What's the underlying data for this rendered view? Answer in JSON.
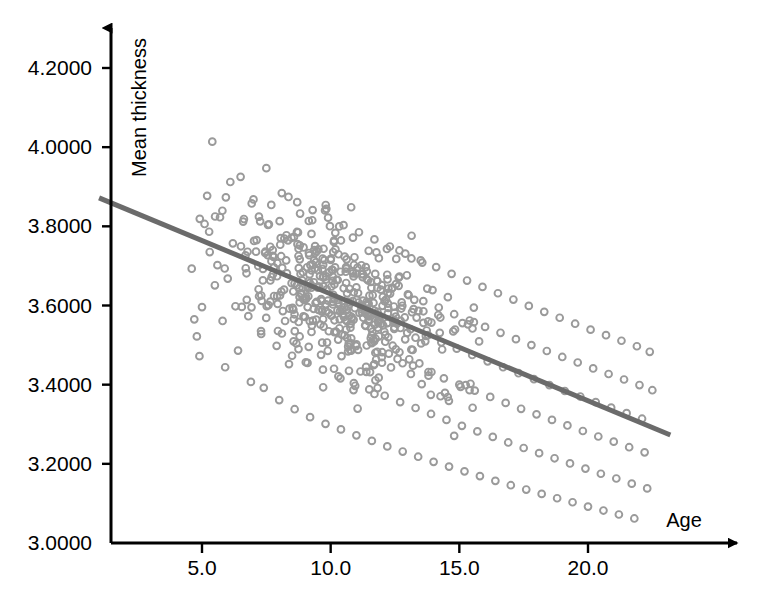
{
  "chart_data": {
    "type": "scatter",
    "title": "",
    "xlabel": "Age",
    "ylabel": "Mean thickness",
    "grid": false,
    "legend": "none",
    "xlim": [
      1.0,
      24.0
    ],
    "ylim": [
      3.0,
      4.28
    ],
    "xticks": [
      "5.0",
      "10.0",
      "15.0",
      "20.0"
    ],
    "xtick_values": [
      5.0,
      10.0,
      15.0,
      20.0
    ],
    "yticks": [
      "3.0000",
      "3.2000",
      "3.4000",
      "3.6000",
      "3.8000",
      "4.0000",
      "4.2000"
    ],
    "ytick_values": [
      3.0,
      3.2,
      3.4,
      3.6,
      3.8,
      4.0,
      4.2
    ],
    "marker_style": "open-circle",
    "marker_color": "#9a9a9a",
    "marker_radius": 3.4,
    "trend_color": "#6b6b6b",
    "axis_color": "#000000",
    "trend_line": {
      "name": "linear fit",
      "x": [
        1.0,
        23.2
      ],
      "y": [
        3.872,
        3.273
      ],
      "slope": -0.027,
      "intercept": 3.899
    },
    "series": [
      {
        "name": "subjects",
        "n_points": 630,
        "points": [
          [
            4.6,
            3.693
          ],
          [
            4.7,
            3.565
          ],
          [
            4.8,
            3.522
          ],
          [
            4.9,
            3.472
          ],
          [
            5.0,
            3.596
          ],
          [
            5.1,
            3.806
          ],
          [
            5.2,
            3.877
          ],
          [
            5.3,
            3.735
          ],
          [
            5.4,
            4.014
          ],
          [
            5.5,
            3.651
          ],
          [
            5.6,
            3.702
          ],
          [
            5.7,
            3.823
          ],
          [
            5.8,
            3.561
          ],
          [
            5.9,
            3.444
          ],
          [
            6.0,
            3.668
          ],
          [
            6.1,
            3.912
          ],
          [
            6.2,
            3.757
          ],
          [
            6.3,
            3.598
          ],
          [
            6.4,
            3.486
          ],
          [
            6.5,
            3.925
          ],
          [
            6.6,
            3.812
          ],
          [
            6.7,
            3.694
          ],
          [
            6.8,
            3.573
          ],
          [
            6.9,
            3.407
          ],
          [
            7.0,
            3.868
          ],
          [
            7.1,
            3.736
          ],
          [
            7.2,
            3.641
          ],
          [
            7.3,
            3.528
          ],
          [
            7.4,
            3.392
          ],
          [
            7.5,
            3.947
          ],
          [
            7.6,
            3.805
          ],
          [
            7.7,
            3.712
          ],
          [
            7.8,
            3.624
          ],
          [
            7.9,
            3.498
          ],
          [
            8.0,
            3.361
          ],
          [
            8.1,
            3.884
          ],
          [
            8.2,
            3.769
          ],
          [
            8.3,
            3.681
          ],
          [
            8.4,
            3.592
          ],
          [
            8.5,
            3.473
          ],
          [
            8.6,
            3.338
          ],
          [
            8.7,
            3.861
          ],
          [
            8.8,
            3.752
          ],
          [
            8.9,
            3.663
          ],
          [
            9.0,
            3.571
          ],
          [
            9.1,
            3.455
          ],
          [
            9.2,
            3.318
          ],
          [
            9.3,
            3.841
          ],
          [
            9.4,
            3.733
          ],
          [
            9.5,
            3.645
          ],
          [
            9.6,
            3.552
          ],
          [
            9.7,
            3.438
          ],
          [
            9.8,
            3.301
          ],
          [
            9.9,
            3.822
          ],
          [
            10.0,
            3.715
          ],
          [
            10.1,
            3.627
          ],
          [
            10.2,
            3.534
          ],
          [
            10.3,
            3.421
          ],
          [
            10.4,
            3.287
          ],
          [
            10.5,
            3.803
          ],
          [
            10.6,
            3.697
          ],
          [
            10.7,
            3.609
          ],
          [
            10.8,
            3.517
          ],
          [
            10.9,
            3.404
          ],
          [
            11.0,
            3.272
          ],
          [
            11.1,
            3.785
          ],
          [
            11.2,
            3.679
          ],
          [
            11.3,
            3.591
          ],
          [
            11.4,
            3.499
          ],
          [
            11.5,
            3.388
          ],
          [
            11.6,
            3.258
          ],
          [
            11.7,
            3.767
          ],
          [
            11.8,
            3.662
          ],
          [
            11.9,
            3.574
          ],
          [
            12.0,
            3.482
          ],
          [
            12.1,
            3.372
          ],
          [
            12.2,
            3.244
          ],
          [
            12.3,
            3.749
          ],
          [
            12.4,
            3.645
          ],
          [
            12.5,
            3.557
          ],
          [
            12.6,
            3.465
          ],
          [
            12.7,
            3.356
          ],
          [
            12.8,
            3.231
          ],
          [
            12.9,
            3.731
          ],
          [
            13.0,
            3.628
          ],
          [
            13.1,
            3.54
          ],
          [
            13.2,
            3.448
          ],
          [
            13.3,
            3.341
          ],
          [
            13.4,
            3.218
          ],
          [
            13.5,
            3.714
          ],
          [
            13.6,
            3.611
          ],
          [
            13.7,
            3.523
          ],
          [
            13.8,
            3.432
          ],
          [
            13.9,
            3.326
          ],
          [
            14.0,
            3.205
          ],
          [
            14.1,
            3.697
          ],
          [
            14.2,
            3.595
          ],
          [
            14.3,
            3.507
          ],
          [
            14.4,
            3.416
          ],
          [
            14.5,
            3.311
          ],
          [
            14.6,
            3.193
          ],
          [
            14.7,
            3.68
          ],
          [
            14.8,
            3.578
          ],
          [
            14.9,
            3.491
          ],
          [
            15.0,
            3.4
          ],
          [
            15.1,
            3.296
          ],
          [
            15.2,
            3.181
          ],
          [
            15.3,
            3.663
          ],
          [
            15.4,
            3.562
          ],
          [
            15.5,
            3.475
          ],
          [
            15.6,
            3.385
          ],
          [
            15.7,
            3.282
          ],
          [
            15.8,
            3.169
          ],
          [
            15.9,
            3.647
          ],
          [
            16.0,
            3.546
          ],
          [
            16.1,
            3.459
          ],
          [
            16.2,
            3.369
          ],
          [
            16.3,
            3.268
          ],
          [
            16.4,
            3.157
          ],
          [
            16.5,
            3.631
          ],
          [
            16.6,
            3.531
          ],
          [
            16.7,
            3.444
          ],
          [
            16.8,
            3.354
          ],
          [
            16.9,
            3.254
          ],
          [
            17.0,
            3.146
          ],
          [
            17.1,
            3.615
          ],
          [
            17.2,
            3.515
          ],
          [
            17.3,
            3.429
          ],
          [
            17.4,
            3.339
          ],
          [
            17.5,
            3.24
          ],
          [
            17.6,
            3.135
          ],
          [
            17.7,
            3.599
          ],
          [
            17.8,
            3.5
          ],
          [
            17.9,
            3.414
          ],
          [
            18.0,
            3.325
          ],
          [
            18.1,
            3.227
          ],
          [
            18.2,
            3.124
          ],
          [
            18.3,
            3.584
          ],
          [
            18.4,
            3.485
          ],
          [
            18.5,
            3.399
          ],
          [
            18.6,
            3.311
          ],
          [
            18.7,
            3.214
          ],
          [
            18.8,
            3.113
          ],
          [
            18.9,
            3.569
          ],
          [
            19.0,
            3.47
          ],
          [
            19.1,
            3.384
          ],
          [
            19.2,
            3.297
          ],
          [
            19.3,
            3.201
          ],
          [
            19.4,
            3.103
          ],
          [
            19.5,
            3.554
          ],
          [
            19.6,
            3.456
          ],
          [
            19.7,
            3.37
          ],
          [
            19.8,
            3.283
          ],
          [
            19.9,
            3.188
          ],
          [
            20.0,
            3.092
          ],
          [
            20.1,
            3.539
          ],
          [
            20.2,
            3.441
          ],
          [
            20.3,
            3.356
          ],
          [
            20.4,
            3.269
          ],
          [
            20.5,
            3.175
          ],
          [
            20.6,
            3.082
          ],
          [
            20.7,
            3.525
          ],
          [
            20.8,
            3.427
          ],
          [
            20.9,
            3.342
          ],
          [
            21.0,
            3.256
          ],
          [
            21.1,
            3.163
          ],
          [
            21.2,
            3.072
          ],
          [
            21.3,
            3.511
          ],
          [
            21.4,
            3.413
          ],
          [
            21.5,
            3.328
          ],
          [
            21.6,
            3.242
          ],
          [
            21.7,
            3.15
          ],
          [
            21.8,
            3.062
          ],
          [
            21.9,
            3.497
          ],
          [
            22.0,
            3.399
          ],
          [
            22.1,
            3.314
          ],
          [
            22.2,
            3.229
          ],
          [
            22.3,
            3.138
          ],
          [
            22.4,
            3.483
          ],
          [
            22.5,
            3.386
          ]
        ]
      }
    ]
  },
  "axes": {
    "x_axis_label": "Age",
    "y_axis_label": "Mean thickness"
  }
}
